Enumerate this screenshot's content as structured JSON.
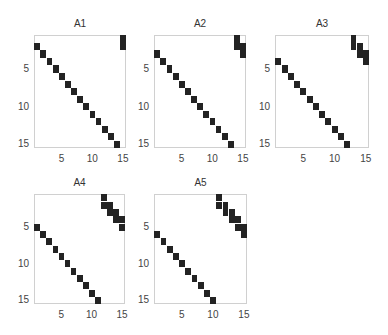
{
  "figure": {
    "background": "#ffffff",
    "cell_color": "#232323",
    "axis_color": "#d0d0d0"
  },
  "chart_data": [
    {
      "type": "heatmap",
      "subtype": "spy (sparsity pattern)",
      "title": "A1",
      "size": [
        15,
        15
      ],
      "xticks": [
        5,
        10,
        15
      ],
      "yticks": [
        5,
        10,
        15
      ],
      "xlim": [
        0.5,
        15.5
      ],
      "ylim": [
        0.5,
        15.5
      ],
      "shift": 1,
      "nonzeros": [
        [
          1,
          15
        ],
        [
          2,
          15
        ],
        [
          2,
          1
        ],
        [
          3,
          2
        ],
        [
          4,
          3
        ],
        [
          5,
          4
        ],
        [
          6,
          5
        ],
        [
          7,
          6
        ],
        [
          8,
          7
        ],
        [
          9,
          8
        ],
        [
          10,
          9
        ],
        [
          11,
          10
        ],
        [
          12,
          11
        ],
        [
          13,
          12
        ],
        [
          14,
          13
        ],
        [
          15,
          14
        ]
      ]
    },
    {
      "type": "heatmap",
      "subtype": "spy (sparsity pattern)",
      "title": "A2",
      "size": [
        15,
        15
      ],
      "xticks": [
        5,
        10,
        15
      ],
      "yticks": [
        5,
        10,
        15
      ],
      "xlim": [
        0.5,
        15.5
      ],
      "ylim": [
        0.5,
        15.5
      ],
      "shift": 2,
      "nonzeros": [
        [
          1,
          14
        ],
        [
          2,
          14
        ],
        [
          2,
          15
        ],
        [
          3,
          15
        ],
        [
          3,
          1
        ],
        [
          4,
          2
        ],
        [
          5,
          3
        ],
        [
          6,
          4
        ],
        [
          7,
          5
        ],
        [
          8,
          6
        ],
        [
          9,
          7
        ],
        [
          10,
          8
        ],
        [
          11,
          9
        ],
        [
          12,
          10
        ],
        [
          13,
          11
        ],
        [
          14,
          12
        ],
        [
          15,
          13
        ]
      ]
    },
    {
      "type": "heatmap",
      "subtype": "spy (sparsity pattern)",
      "title": "A3",
      "size": [
        15,
        15
      ],
      "xticks": [
        5,
        10,
        15
      ],
      "yticks": [
        5,
        10,
        15
      ],
      "xlim": [
        0.5,
        15.5
      ],
      "ylim": [
        0.5,
        15.5
      ],
      "shift": 3,
      "nonzeros": [
        [
          1,
          13
        ],
        [
          2,
          13
        ],
        [
          2,
          14
        ],
        [
          3,
          14
        ],
        [
          3,
          15
        ],
        [
          4,
          15
        ],
        [
          4,
          1
        ],
        [
          5,
          2
        ],
        [
          6,
          3
        ],
        [
          7,
          4
        ],
        [
          8,
          5
        ],
        [
          9,
          6
        ],
        [
          10,
          7
        ],
        [
          11,
          8
        ],
        [
          12,
          9
        ],
        [
          13,
          10
        ],
        [
          14,
          11
        ],
        [
          15,
          12
        ]
      ]
    },
    {
      "type": "heatmap",
      "subtype": "spy (sparsity pattern)",
      "title": "A4",
      "size": [
        15,
        15
      ],
      "xticks": [
        5,
        10,
        15
      ],
      "yticks": [
        5,
        10,
        15
      ],
      "xlim": [
        0.5,
        15.5
      ],
      "ylim": [
        0.5,
        15.5
      ],
      "shift": 4,
      "nonzeros": [
        [
          1,
          12
        ],
        [
          2,
          12
        ],
        [
          2,
          13
        ],
        [
          3,
          13
        ],
        [
          3,
          14
        ],
        [
          4,
          14
        ],
        [
          4,
          15
        ],
        [
          5,
          15
        ],
        [
          5,
          1
        ],
        [
          6,
          2
        ],
        [
          7,
          3
        ],
        [
          8,
          4
        ],
        [
          9,
          5
        ],
        [
          10,
          6
        ],
        [
          11,
          7
        ],
        [
          12,
          8
        ],
        [
          13,
          9
        ],
        [
          14,
          10
        ],
        [
          15,
          11
        ]
      ]
    },
    {
      "type": "heatmap",
      "subtype": "spy (sparsity pattern)",
      "title": "A5",
      "size": [
        15,
        15
      ],
      "xticks": [
        5,
        10,
        15
      ],
      "yticks": [
        5,
        10,
        15
      ],
      "xlim": [
        0.5,
        15.5
      ],
      "ylim": [
        0.5,
        15.5
      ],
      "shift": 5,
      "nonzeros": [
        [
          1,
          11
        ],
        [
          2,
          11
        ],
        [
          2,
          12
        ],
        [
          3,
          12
        ],
        [
          3,
          13
        ],
        [
          4,
          13
        ],
        [
          4,
          14
        ],
        [
          5,
          14
        ],
        [
          5,
          15
        ],
        [
          6,
          15
        ],
        [
          6,
          1
        ],
        [
          7,
          2
        ],
        [
          8,
          3
        ],
        [
          9,
          4
        ],
        [
          10,
          5
        ],
        [
          11,
          6
        ],
        [
          12,
          7
        ],
        [
          13,
          8
        ],
        [
          14,
          9
        ],
        [
          15,
          10
        ]
      ]
    }
  ]
}
